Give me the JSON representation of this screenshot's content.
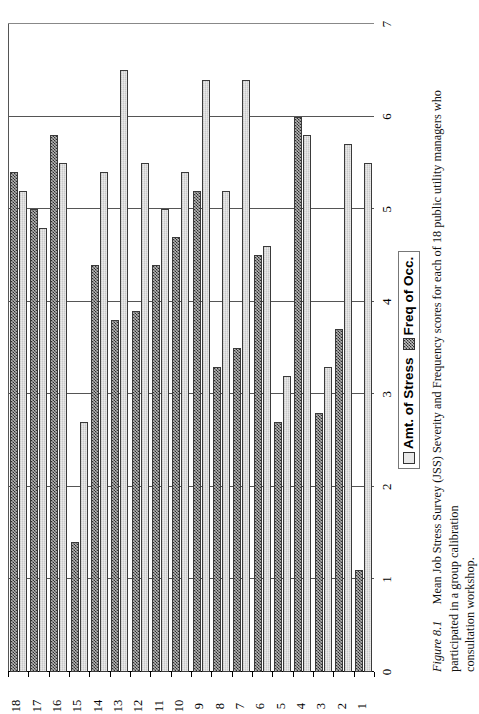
{
  "figure": {
    "number_label": "Figure 8.1",
    "caption_line1": "Mean Job Stress Survey (JSS) Severity and Frequency scores for each of 18 public utility managers who participated in a group calibration",
    "caption_line2": "consultation workshop."
  },
  "legend": {
    "position": "bottom-center",
    "items": [
      {
        "label": "Amt. of Stress",
        "swatch": "light-grey-solid"
      },
      {
        "label": "Freq of Occ.",
        "swatch": "dark-checkerboard"
      }
    ]
  },
  "axes": {
    "value_axis_ticks": [
      "0",
      "1",
      "2",
      "3",
      "4",
      "5",
      "6",
      "7"
    ],
    "category_axis_ticks": [
      "1",
      "2",
      "3",
      "4",
      "5",
      "6",
      "7",
      "8",
      "9",
      "10",
      "11",
      "12",
      "13",
      "14",
      "15",
      "16",
      "17",
      "18"
    ]
  },
  "chart_data": {
    "type": "bar",
    "orientation": "horizontal",
    "title": "",
    "subtitle": "",
    "xlabel": "",
    "ylabel": "",
    "xlim": [
      0,
      7
    ],
    "grid": true,
    "legend_position": "bottom",
    "categories": [
      "1",
      "2",
      "3",
      "4",
      "5",
      "6",
      "7",
      "8",
      "9",
      "10",
      "11",
      "12",
      "13",
      "14",
      "15",
      "16",
      "17",
      "18"
    ],
    "series": [
      {
        "name": "Amt. of Stress",
        "values": [
          5.5,
          5.7,
          3.3,
          5.8,
          3.2,
          4.6,
          6.4,
          5.2,
          6.4,
          5.4,
          5.0,
          5.5,
          6.5,
          5.4,
          2.7,
          5.5,
          4.8,
          5.2
        ]
      },
      {
        "name": "Freq of Occ.",
        "values": [
          1.1,
          3.7,
          2.8,
          6.0,
          2.7,
          4.5,
          3.5,
          3.3,
          5.2,
          4.7,
          4.4,
          3.9,
          3.8,
          4.4,
          1.4,
          5.8,
          5.0,
          5.4
        ]
      }
    ],
    "tick_values": [
      0,
      1,
      2,
      3,
      4,
      5,
      6,
      7
    ]
  }
}
